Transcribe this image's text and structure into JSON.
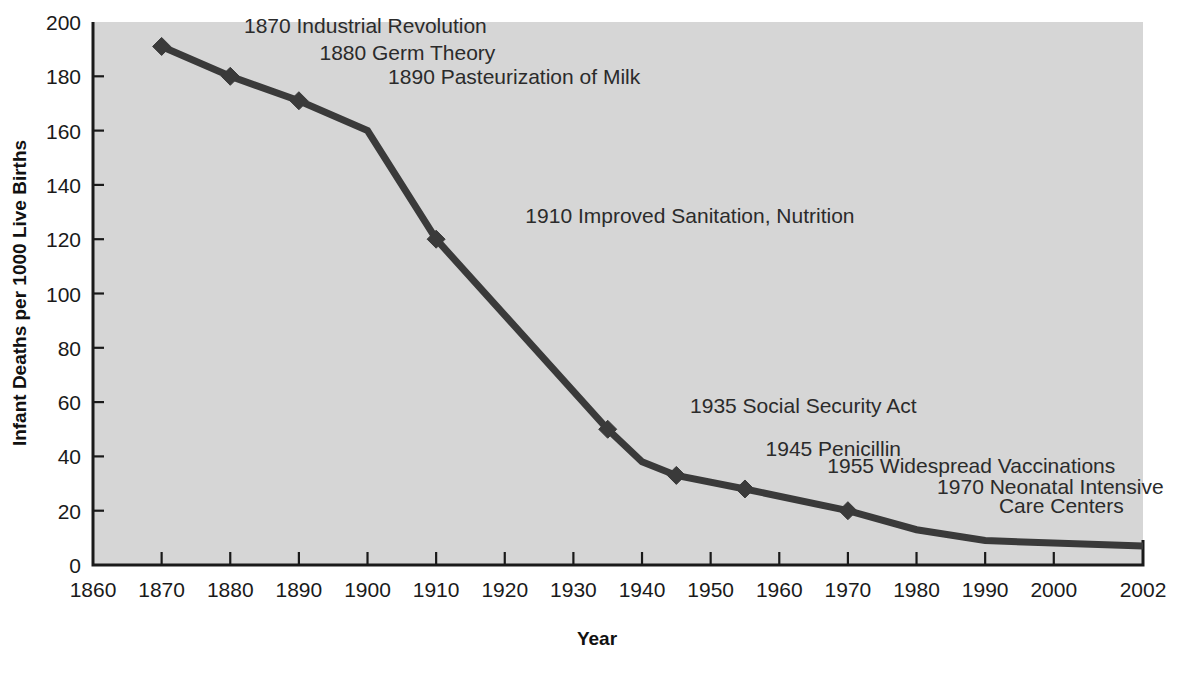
{
  "chart_data": {
    "type": "line",
    "title": "",
    "xlabel": "Year",
    "ylabel": "Infant Deaths per 1000 Live Births",
    "xlim": [
      1860,
      2002
    ],
    "ylim": [
      0,
      200
    ],
    "grid": false,
    "legend": "none",
    "x_ticks": [
      "1860",
      "1870",
      "1880",
      "1890",
      "1900",
      "1910",
      "1920",
      "1930",
      "1940",
      "1950",
      "1960",
      "1970",
      "1980",
      "1990",
      "2000",
      "2002"
    ],
    "x_tick_values": [
      1860,
      1870,
      1880,
      1890,
      1900,
      1910,
      1920,
      1930,
      1940,
      1950,
      1960,
      1970,
      1980,
      1990,
      2000,
      2002
    ],
    "y_ticks": [
      "0",
      "20",
      "40",
      "60",
      "80",
      "100",
      "120",
      "140",
      "160",
      "180",
      "200"
    ],
    "y_tick_values": [
      0,
      20,
      40,
      60,
      80,
      100,
      120,
      140,
      160,
      180,
      200
    ],
    "series": [
      {
        "name": "Infant mortality rate",
        "x": [
          1870,
          1880,
          1890,
          1900,
          1910,
          1935,
          1940,
          1945,
          1955,
          1970,
          1980,
          1990,
          2002
        ],
        "values": [
          191,
          180,
          171,
          160,
          120,
          50,
          38,
          33,
          28,
          20,
          13,
          9,
          7
        ],
        "markers_at_x": [
          1870,
          1880,
          1890,
          1910,
          1935,
          1945,
          1955,
          1970
        ]
      }
    ],
    "annotations": [
      {
        "label": "1870 Industrial Revolution",
        "x": 1870,
        "y": 191,
        "text_x": 1882,
        "text_y": 196
      },
      {
        "label": "1880 Germ Theory",
        "x": 1880,
        "y": 180,
        "text_x": 1893,
        "text_y": 186
      },
      {
        "label": "1890 Pasteurization of Milk",
        "x": 1890,
        "y": 171,
        "text_x": 1903,
        "text_y": 177
      },
      {
        "label": "1910 Improved Sanitation, Nutrition",
        "x": 1910,
        "y": 120,
        "text_x": 1923,
        "text_y": 126
      },
      {
        "label": "1935 Social Security Act",
        "x": 1935,
        "y": 50,
        "text_x": 1947,
        "text_y": 56
      },
      {
        "label": "1945 Penicillin",
        "x": 1945,
        "y": 33,
        "text_x": 1958,
        "text_y": 40
      },
      {
        "label": "1955 Widespread Vaccinations",
        "x": 1955,
        "y": 28,
        "text_x": 1967,
        "text_y": 34
      },
      {
        "label": "1970 Neonatal Intensive",
        "x": 1970,
        "y": 20,
        "text_x": 1983,
        "text_y": 26
      },
      {
        "label": "Care Centers",
        "x": null,
        "y": null,
        "text_x": 1992,
        "text_y": 19
      }
    ],
    "colors": {
      "plot_background": "#d6d6d6",
      "page_background": "#ffffff",
      "line": "#3a3a3a",
      "axis": "#1a1a1a",
      "text": "#2b2b2b"
    }
  }
}
